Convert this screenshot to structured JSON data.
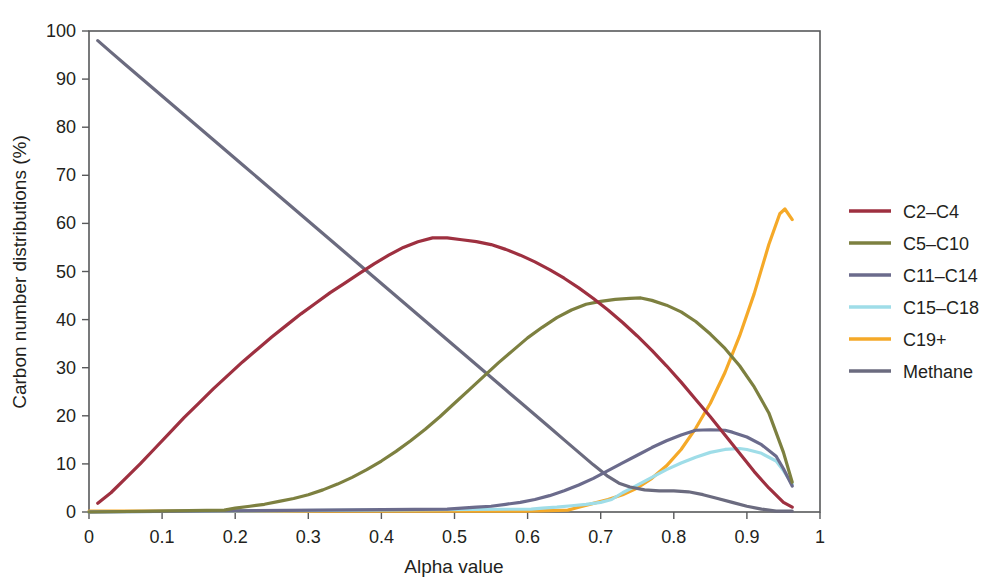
{
  "chart_data": {
    "type": "line",
    "title": "",
    "xlabel": "Alpha value",
    "ylabel": "Carbon number distributions (%)",
    "xlim": [
      0,
      1
    ],
    "ylim": [
      0,
      100
    ],
    "xticks": [
      "0",
      "0.1",
      "0.2",
      "0.3",
      "0.4",
      "0.5",
      "0.6",
      "0.7",
      "0.8",
      "0.9",
      "1"
    ],
    "xtick_values": [
      0,
      0.1,
      0.2,
      0.3,
      0.4,
      0.5,
      0.6,
      0.7,
      0.8,
      0.9,
      1
    ],
    "yticks": [
      "0",
      "10",
      "20",
      "30",
      "40",
      "50",
      "60",
      "70",
      "80",
      "90",
      "100"
    ],
    "ytick_values": [
      0,
      10,
      20,
      30,
      40,
      50,
      60,
      70,
      80,
      90,
      100
    ],
    "grid": false,
    "legend_position": "right",
    "series": [
      {
        "name": "C2–C4",
        "color": "#9e3040",
        "x": [
          0.012,
          0.03,
          0.05,
          0.07,
          0.09,
          0.11,
          0.13,
          0.15,
          0.17,
          0.19,
          0.21,
          0.23,
          0.25,
          0.27,
          0.29,
          0.31,
          0.33,
          0.35,
          0.37,
          0.39,
          0.41,
          0.43,
          0.45,
          0.47,
          0.49,
          0.51,
          0.53,
          0.55,
          0.57,
          0.59,
          0.61,
          0.63,
          0.65,
          0.67,
          0.69,
          0.71,
          0.73,
          0.75,
          0.77,
          0.79,
          0.81,
          0.83,
          0.85,
          0.87,
          0.89,
          0.91,
          0.93,
          0.95,
          0.962
        ],
        "y": [
          1.8,
          4.0,
          7.0,
          10.0,
          13.2,
          16.4,
          19.6,
          22.6,
          25.6,
          28.4,
          31.2,
          33.8,
          36.4,
          38.8,
          41.2,
          43.4,
          45.6,
          47.6,
          49.6,
          51.6,
          53.4,
          55.0,
          56.2,
          57.0,
          57.0,
          56.6,
          56.2,
          55.6,
          54.6,
          53.4,
          52.0,
          50.4,
          48.6,
          46.6,
          44.4,
          42.0,
          39.4,
          36.6,
          33.6,
          30.4,
          27.0,
          23.4,
          19.8,
          16.0,
          12.2,
          8.4,
          5.0,
          2.0,
          1.0
        ]
      },
      {
        "name": "C5–C10",
        "color": "#7d8040",
        "x": [
          0.0,
          0.185,
          0.2,
          0.22,
          0.24,
          0.26,
          0.28,
          0.3,
          0.32,
          0.34,
          0.36,
          0.38,
          0.4,
          0.42,
          0.44,
          0.46,
          0.48,
          0.5,
          0.52,
          0.54,
          0.56,
          0.58,
          0.6,
          0.62,
          0.64,
          0.66,
          0.68,
          0.7,
          0.72,
          0.74,
          0.755,
          0.77,
          0.79,
          0.81,
          0.83,
          0.85,
          0.87,
          0.89,
          0.91,
          0.93,
          0.95,
          0.962
        ],
        "y": [
          0.0,
          0.4,
          0.8,
          1.2,
          1.6,
          2.2,
          2.8,
          3.6,
          4.6,
          5.8,
          7.2,
          8.8,
          10.6,
          12.6,
          14.8,
          17.2,
          19.8,
          22.6,
          25.4,
          28.2,
          31.0,
          33.6,
          36.2,
          38.4,
          40.4,
          42.0,
          43.2,
          43.8,
          44.2,
          44.4,
          44.5,
          44.0,
          43.0,
          41.6,
          39.6,
          37.0,
          34.0,
          30.4,
          26.0,
          20.6,
          12.4,
          6.2
        ]
      },
      {
        "name": "C11–C14",
        "color": "#6b6b8c",
        "x": [
          0.0,
          0.49,
          0.51,
          0.53,
          0.55,
          0.57,
          0.59,
          0.61,
          0.63,
          0.65,
          0.67,
          0.69,
          0.71,
          0.73,
          0.75,
          0.77,
          0.79,
          0.81,
          0.83,
          0.85,
          0.87,
          0.88,
          0.9,
          0.92,
          0.94,
          0.95,
          0.962
        ],
        "y": [
          0.0,
          0.6,
          0.8,
          1.0,
          1.2,
          1.6,
          2.0,
          2.6,
          3.4,
          4.4,
          5.6,
          7.0,
          8.6,
          10.2,
          11.8,
          13.4,
          14.8,
          16.0,
          17.0,
          17.1,
          17.0,
          16.6,
          15.6,
          14.0,
          11.6,
          9.0,
          5.4
        ]
      },
      {
        "name": "C15–C18",
        "color": "#9fdde8",
        "x": [
          0.0,
          0.605,
          0.62,
          0.64,
          0.66,
          0.68,
          0.7,
          0.715,
          0.73,
          0.75,
          0.77,
          0.79,
          0.81,
          0.83,
          0.85,
          0.87,
          0.89,
          0.9,
          0.92,
          0.94,
          0.95,
          0.962
        ],
        "y": [
          0.0,
          0.6,
          0.8,
          1.0,
          1.3,
          1.6,
          2.0,
          2.6,
          4.0,
          5.6,
          7.2,
          8.8,
          10.2,
          11.4,
          12.4,
          13.0,
          13.2,
          13.0,
          12.2,
          10.6,
          8.6,
          5.8
        ]
      },
      {
        "name": "C19+",
        "color": "#f5a928",
        "x": [
          0.0,
          0.1,
          0.2,
          0.3,
          0.4,
          0.5,
          0.6,
          0.655,
          0.67,
          0.69,
          0.71,
          0.73,
          0.75,
          0.77,
          0.79,
          0.81,
          0.83,
          0.85,
          0.87,
          0.89,
          0.91,
          0.93,
          0.945,
          0.952,
          0.962
        ],
        "y": [
          0.2,
          0.2,
          0.2,
          0.2,
          0.2,
          0.2,
          0.2,
          0.4,
          1.0,
          1.8,
          2.6,
          3.6,
          5.0,
          7.0,
          9.6,
          13.0,
          17.4,
          22.6,
          29.0,
          36.6,
          45.4,
          55.6,
          62.0,
          63.0,
          60.8
        ]
      },
      {
        "name": "Methane",
        "color": "#6b6b7f",
        "x": [
          0.012,
          0.03,
          0.05,
          0.07,
          0.09,
          0.11,
          0.13,
          0.15,
          0.17,
          0.19,
          0.21,
          0.23,
          0.25,
          0.27,
          0.29,
          0.31,
          0.33,
          0.35,
          0.37,
          0.39,
          0.41,
          0.43,
          0.45,
          0.47,
          0.49,
          0.51,
          0.53,
          0.55,
          0.57,
          0.59,
          0.61,
          0.63,
          0.65,
          0.67,
          0.69,
          0.71,
          0.725,
          0.74,
          0.76,
          0.78,
          0.8,
          0.82,
          0.84,
          0.86,
          0.88,
          0.9,
          0.92,
          0.94,
          0.962
        ],
        "y": [
          98.0,
          95.6,
          93.0,
          90.4,
          87.8,
          85.2,
          82.6,
          80.0,
          77.4,
          74.8,
          72.2,
          69.6,
          67.0,
          64.4,
          61.8,
          59.2,
          56.6,
          54.0,
          51.4,
          48.8,
          46.2,
          43.6,
          41.0,
          38.4,
          35.8,
          33.2,
          30.6,
          28.0,
          25.4,
          22.8,
          20.2,
          17.6,
          15.0,
          12.4,
          9.8,
          7.4,
          6.0,
          5.2,
          4.6,
          4.4,
          4.4,
          4.2,
          3.6,
          2.8,
          2.0,
          1.2,
          0.6,
          0.2,
          0.2
        ]
      }
    ]
  },
  "legend": {
    "items": [
      {
        "label": "C2–C4",
        "color": "#9e3040"
      },
      {
        "label": "C5–C10",
        "color": "#7d8040"
      },
      {
        "label": "C11–C14",
        "color": "#6b6b8c"
      },
      {
        "label": "C15–C18",
        "color": "#9fdde8"
      },
      {
        "label": "C19+",
        "color": "#f5a928"
      },
      {
        "label": "Methane",
        "color": "#6b6b7f"
      }
    ]
  },
  "axes": {
    "x_label": "Alpha value",
    "y_label": "Carbon number distributions (%)"
  }
}
